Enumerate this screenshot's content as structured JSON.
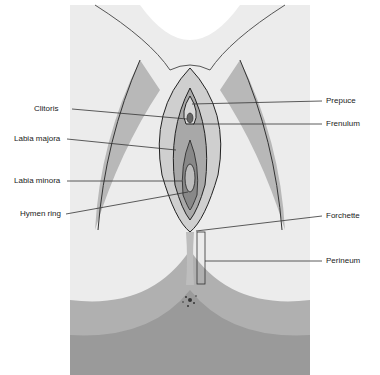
{
  "diagram": {
    "labels_left": [
      {
        "text": "Clitoris",
        "x": 34,
        "y": 104
      },
      {
        "text": "Labia majora",
        "x": 14,
        "y": 134
      },
      {
        "text": "Labia minora",
        "x": 14,
        "y": 176
      },
      {
        "text": "Hymen ring",
        "x": 20,
        "y": 209
      }
    ],
    "labels_right": [
      {
        "text": "Prepuce",
        "x": 326,
        "y": 96
      },
      {
        "text": "Frenulum",
        "x": 326,
        "y": 121
      },
      {
        "text": "Forchette",
        "x": 326,
        "y": 211
      },
      {
        "text": "Perineum",
        "x": 326,
        "y": 256
      }
    ]
  }
}
